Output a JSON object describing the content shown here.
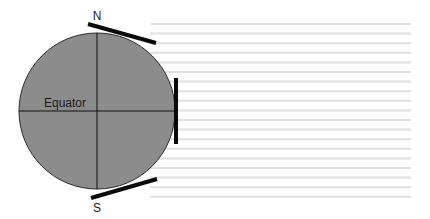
{
  "labels": {
    "north": "N",
    "south": "S",
    "equator": "Equator"
  },
  "colors": {
    "earth_fill": "#8c8c8c",
    "earth_stroke": "#2a2a2a",
    "axis_lines": "#111111",
    "tangent_bars": "#0a0a0a",
    "sun_rays": "#e0e0e0",
    "background": "#ffffff"
  },
  "sun_rays": {
    "count": 19,
    "x_start": 150,
    "x_end": 411,
    "y_first": 24,
    "spacing": 9.6
  }
}
